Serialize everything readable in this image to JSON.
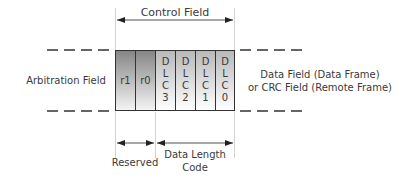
{
  "diagram": {
    "control_field_label": "Control Field",
    "arbitration_field_label": "Arbitration Field",
    "data_field_line1": "Data Field (Data Frame)",
    "data_field_line2": "or CRC Field (Remote Frame)",
    "reserved_label": "Reserved",
    "dlc_label_line1": "Data Length",
    "dlc_label_line2": "Code",
    "cells": [
      {
        "id": "r1",
        "lines": [
          "r1"
        ],
        "style": "dark"
      },
      {
        "id": "r0",
        "lines": [
          "r0"
        ],
        "style": "dark"
      },
      {
        "id": "dlc3",
        "lines": [
          "D",
          "L",
          "C",
          "3"
        ],
        "style": "light"
      },
      {
        "id": "dlc2",
        "lines": [
          "D",
          "L",
          "C",
          "2"
        ],
        "style": "light"
      },
      {
        "id": "dlc1",
        "lines": [
          "D",
          "L",
          "C",
          "1"
        ],
        "style": "light"
      },
      {
        "id": "dlc0",
        "lines": [
          "D",
          "L",
          "C",
          "0"
        ],
        "style": "light"
      }
    ],
    "colors": {
      "dark_top": "#8a8a8a",
      "dark_bottom": "#f2f2f2",
      "light_top": "#bdbdbd",
      "light_bottom": "#ffffff",
      "line": "#333333",
      "guide": "#d0d0d0"
    }
  }
}
